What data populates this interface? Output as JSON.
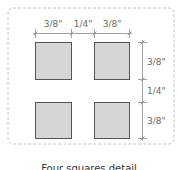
{
  "diagram": {
    "caption": "Four squares detail",
    "horizontal_dimensions": [
      "3/8\"",
      "1/4\"",
      "3/8\""
    ],
    "vertical_dimensions": [
      "3/8\"",
      "1/4\"",
      "3/8\""
    ],
    "colors": {
      "square_fill": "#d6d6d6",
      "square_stroke": "#555555",
      "dim_line": "#888888",
      "border": "#bdbdbd"
    }
  }
}
